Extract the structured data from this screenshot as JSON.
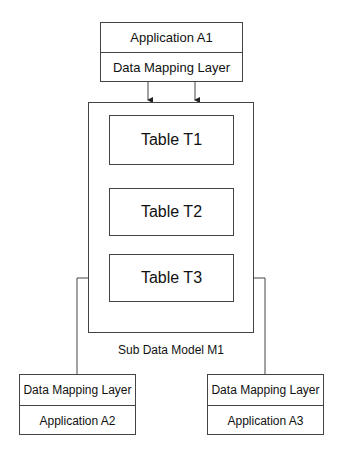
{
  "diagram": {
    "top_component": {
      "application": "Application A1",
      "mapping_layer": "Data Mapping Layer"
    },
    "sub_model": {
      "label": "Sub Data Model M1",
      "tables": [
        {
          "label": "Table T1"
        },
        {
          "label": "Table T2"
        },
        {
          "label": "Table T3"
        }
      ]
    },
    "bottom_left_component": {
      "mapping_layer": "Data Mapping Layer",
      "application": "Application A2"
    },
    "bottom_right_component": {
      "mapping_layer": "Data Mapping Layer",
      "application": "Application A3"
    }
  }
}
